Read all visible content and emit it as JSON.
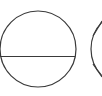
{
  "canvas": {
    "width": 102,
    "height": 96,
    "background": "#ffffff"
  },
  "stroke": {
    "color": "#3a3a3a",
    "width": 1.2
  },
  "shapes": [
    {
      "name": "circle-with-horizontal-line",
      "cx": 38,
      "cy": 49,
      "r": 38,
      "line": {
        "x1": 0,
        "y1": 56.5,
        "x2": 75,
        "y2": 56.5
      }
    },
    {
      "name": "circle-with-wedge-lines",
      "cx": 129,
      "cy": 49,
      "r": 38,
      "lines": [
        {
          "x1": 93,
          "y1": 36,
          "x2": 102,
          "y2": 21
        },
        {
          "x1": 93,
          "y1": 64,
          "x2": 102,
          "y2": 77
        }
      ]
    }
  ]
}
